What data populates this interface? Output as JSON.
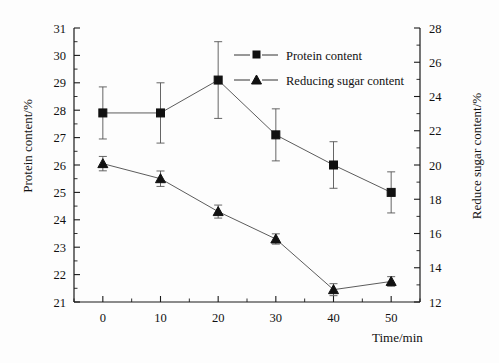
{
  "chart_data": {
    "type": "line",
    "title": "",
    "subtitle": "",
    "xlabel": "Time/min",
    "ylabel": "Protein content/%",
    "ylabel_right": "Reduce sugar content/%",
    "x": [
      0,
      10,
      20,
      30,
      40,
      50
    ],
    "xlim": [
      -5,
      55
    ],
    "xticks": [
      0,
      10,
      20,
      30,
      40,
      50
    ],
    "xtick_labels": [
      "0",
      "10",
      "20",
      "30",
      "40",
      "50"
    ],
    "ylim": [
      21,
      31
    ],
    "yticks": [
      21,
      22,
      23,
      24,
      25,
      26,
      27,
      28,
      29,
      30,
      31
    ],
    "ytick_labels": [
      "21",
      "22",
      "23",
      "24",
      "25",
      "26",
      "27",
      "28",
      "29",
      "30",
      "31"
    ],
    "ylim_right": [
      12,
      28
    ],
    "yticks_right": [
      12,
      14,
      16,
      18,
      20,
      22,
      24,
      26,
      28
    ],
    "ytick_labels_right": [
      "12",
      "14",
      "16",
      "18",
      "20",
      "22",
      "24",
      "26",
      "28"
    ],
    "grid": false,
    "legend_position": "upper-right-inside",
    "series": [
      {
        "name": "Protein content",
        "axis": "left",
        "marker": "square",
        "values": [
          27.9,
          27.9,
          29.1,
          27.1,
          26.0,
          25.0
        ],
        "errors": [
          0.95,
          1.1,
          1.4,
          0.95,
          0.85,
          0.75
        ]
      },
      {
        "name": "Reducing sugar content",
        "axis": "right",
        "marker": "triangle",
        "values": [
          20.6,
          19.6,
          18.1,
          16.1,
          12.85,
          13.4
        ],
        "values_left_scale": [
          26.05,
          25.5,
          24.3,
          23.3,
          21.45,
          21.75
        ],
        "errors": [
          0.42,
          0.45,
          0.38,
          0.3,
          0.35,
          0.28
        ]
      }
    ],
    "legend": [
      {
        "label": "Protein content",
        "marker": "square"
      },
      {
        "label": "Reducing sugar content",
        "marker": "triangle"
      }
    ],
    "colors": {
      "line": "#4a4a4a",
      "marker": "#111111",
      "axis": "#1a1a1a",
      "background": "#fdfdfd"
    }
  }
}
